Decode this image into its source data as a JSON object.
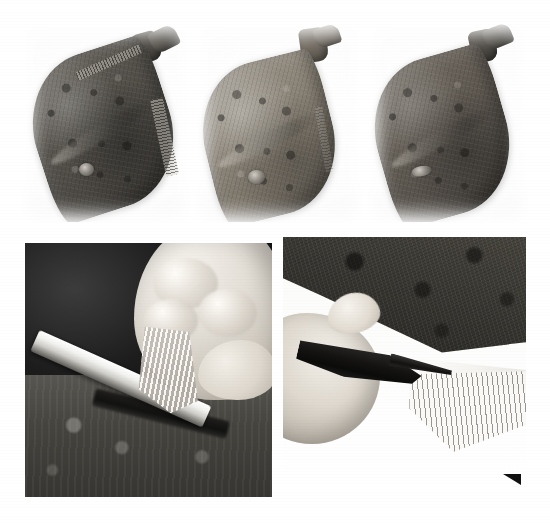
{
  "figure": {
    "background_color": "#ffffff",
    "width": 550,
    "height": 523,
    "layout": "2-row photographic plate, 3 panels on top, 2 panels below",
    "corner_marker": {
      "name": "crop-corner-triangle",
      "color": "#111111",
      "x": 503,
      "y": 474,
      "size": 18
    }
  },
  "panels": [
    {
      "id": "top-1",
      "row": "top",
      "index": 1,
      "caption": "Whole flatfish, dark side up, fins untrimmed",
      "subject": "flatfish",
      "view": "dark (eyed) side, head to upper right",
      "background": "#ffffff",
      "x": 22,
      "y": 24,
      "width": 168,
      "height": 198,
      "fish": {
        "skin_tone": "#4a4742",
        "highlight": "#6e6a63",
        "fin_fringe": "visible full ray fringe along lower-right edge",
        "tail": "intact",
        "eye_bump": "pale raised eye cluster near lower-left"
      }
    },
    {
      "id": "top-2",
      "row": "top",
      "index": 2,
      "caption": "Same fish, lighter mottled side, fins partly trimmed",
      "subject": "flatfish",
      "view": "pale mottled side, head to upper right",
      "background": "#ffffff",
      "x": 196,
      "y": 24,
      "width": 166,
      "height": 198,
      "fish": {
        "skin_tone": "#807b72",
        "highlight": "#a29c92",
        "fin_fringe": "fringe mostly removed, smooth outline",
        "tail": "intact",
        "eye_bump": "pale raised eye cluster near lower-left"
      }
    },
    {
      "id": "top-3",
      "row": "top",
      "index": 3,
      "caption": "Fish with all fins trimmed flush to the body",
      "subject": "flatfish",
      "view": "dark side, head to upper right",
      "background": "#ffffff",
      "x": 368,
      "y": 24,
      "width": 160,
      "height": 198,
      "fish": {
        "skin_tone": "#55514a",
        "highlight": "#7b756c",
        "fin_fringe": "trimmed clean, no ray fringe",
        "tail": "intact",
        "eye_bump": "pale scar patch near lower-left"
      }
    },
    {
      "id": "bottom-1",
      "row": "bottom",
      "index": 1,
      "caption": "Close-up: knife blade slid beneath a fin while the hand lifts it",
      "subject": "hand, knife, fin",
      "background": "#1d1d1d",
      "x": 25,
      "y": 243,
      "width": 247,
      "height": 254,
      "elements": [
        "knife-blade",
        "hand",
        "thumb",
        "fin",
        "cutting-board"
      ]
    },
    {
      "id": "bottom-2",
      "row": "bottom",
      "index": 2,
      "caption": "Close-up: scissors snipping the fin rays along the body edge",
      "subject": "hand, scissors, fish edge",
      "background": "#ffffff",
      "x": 283,
      "y": 237,
      "width": 243,
      "height": 253,
      "elements": [
        "scissors",
        "hand",
        "index-finger",
        "fish-body",
        "fin-rays"
      ]
    }
  ]
}
